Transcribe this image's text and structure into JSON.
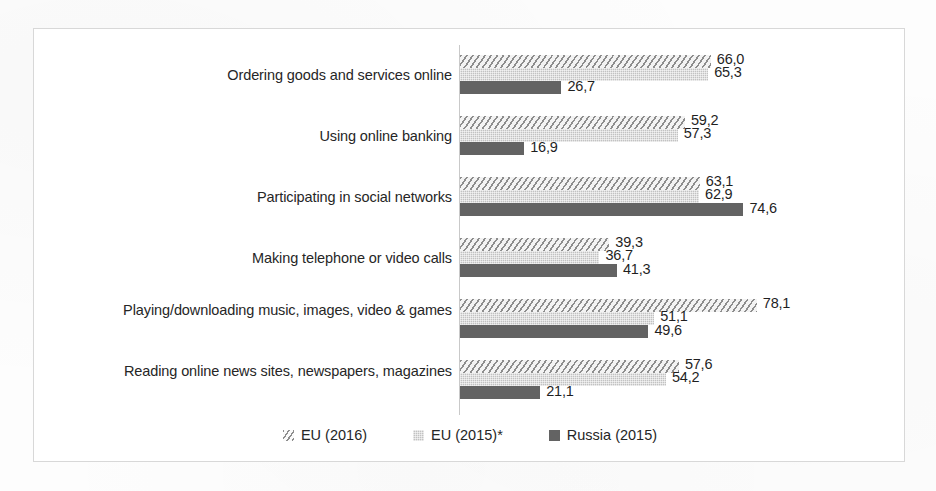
{
  "chart_data": {
    "type": "bar",
    "orientation": "horizontal",
    "title": "",
    "xlabel": "",
    "ylabel": "",
    "grid": false,
    "legend_position": "bottom",
    "xlim": [
      0,
      80
    ],
    "categories": [
      "Ordering goods and services online",
      "Using online banking",
      "Participating in social networks",
      "Making telephone or video calls",
      "Playing/downloading music, images, video & games",
      "Reading online news sites, newspapers, magazines"
    ],
    "series": [
      {
        "name": "EU (2016)",
        "values": [
          66.0,
          59.2,
          63.1,
          39.3,
          78.1,
          57.6
        ]
      },
      {
        "name": "EU (2015)*",
        "values": [
          65.3,
          57.3,
          62.9,
          36.7,
          51.1,
          54.2
        ]
      },
      {
        "name": "Russia (2015)",
        "values": [
          26.7,
          16.9,
          74.6,
          41.3,
          49.6,
          21.1
        ]
      }
    ],
    "value_labels": [
      [
        "66,0",
        "65,3",
        "26,7"
      ],
      [
        "59,2",
        "57,3",
        "16,9"
      ],
      [
        "63,1",
        "62,9",
        "74,6"
      ],
      [
        "39,3",
        "36,7",
        "41,3"
      ],
      [
        "78,1",
        "51,1",
        "49,6"
      ],
      [
        "57,6",
        "54,2",
        "21,1"
      ]
    ]
  },
  "legend": {
    "items": [
      {
        "label": "EU (2016)",
        "pattern": "diagonal-hatch",
        "color": "#8d8d8d"
      },
      {
        "label": "EU (2015)*",
        "pattern": "stipple",
        "color": "#c2c2c2"
      },
      {
        "label": "Russia (2015)",
        "pattern": "solid",
        "color": "#636363"
      }
    ]
  },
  "style": {
    "frame_color": "#d8d8d8",
    "axis_color": "#c9c9c9",
    "text_color": "#262626",
    "background": "#ffffff"
  }
}
